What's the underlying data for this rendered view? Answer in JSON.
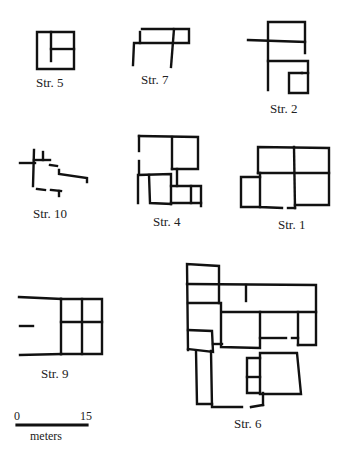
{
  "figure": {
    "structures": [
      {
        "id": "str5",
        "label": "Str. 5"
      },
      {
        "id": "str7",
        "label": "Str. 7"
      },
      {
        "id": "str2",
        "label": "Str. 2"
      },
      {
        "id": "str10",
        "label": "Str. 10"
      },
      {
        "id": "str4",
        "label": "Str. 4"
      },
      {
        "id": "str1",
        "label": "Str. 1"
      },
      {
        "id": "str9",
        "label": "Str. 9"
      },
      {
        "id": "str6",
        "label": "Str. 6"
      }
    ],
    "scale": {
      "start": "0",
      "end": "15",
      "unit": "meters"
    }
  }
}
